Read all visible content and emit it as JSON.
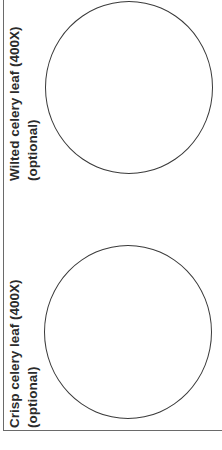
{
  "worksheet": {
    "panels": [
      {
        "title": "Wilted celery leaf (400X)",
        "subtitle": "(optional)",
        "drawing_area": "circle"
      },
      {
        "title": "Crisp celery leaf (400X)",
        "subtitle": "(optional)",
        "drawing_area": "circle"
      }
    ]
  }
}
